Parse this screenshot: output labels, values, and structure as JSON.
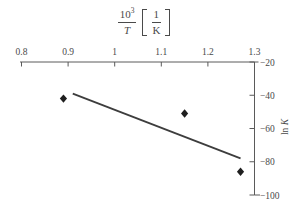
{
  "figure": {
    "background": "#ffffff",
    "axis_color": "#5a5a5a",
    "text_color": "#4a4a4a",
    "point_color": "#1f1f1f",
    "line_color": "#3d3d3d"
  },
  "title": {
    "numerator_base": "10",
    "numerator_exp": "3",
    "denominator": "T",
    "bracket_numerator": "1",
    "bracket_denominator": "K"
  },
  "chart_data": {
    "type": "scatter",
    "xlabel": "10^3/T [1/K]",
    "ylabel_prefix": "ln ",
    "ylabel_symbol": "K",
    "x_axis_position": "top",
    "y_axis_position": "right",
    "grid": false,
    "legend": false,
    "xlim": [
      0.8,
      1.3
    ],
    "ylim": [
      -100,
      -20
    ],
    "x_ticks": [
      0.8,
      0.9,
      1,
      1.1,
      1.2,
      1.3
    ],
    "x_tick_labels": [
      "0.8",
      "0.9",
      "1",
      "1.1",
      "1.2",
      "1.3"
    ],
    "y_ticks": [
      -20,
      -40,
      -60,
      -80,
      -100
    ],
    "y_tick_labels": [
      "−20",
      "−40",
      "−60",
      "−80",
      "−100"
    ],
    "marker": "diamond",
    "points": [
      {
        "x": 0.89,
        "y": -42
      },
      {
        "x": 1.15,
        "y": -51
      },
      {
        "x": 1.27,
        "y": -86
      }
    ],
    "fit_line": {
      "x1": 0.91,
      "y1": -39,
      "x2": 1.27,
      "y2": -78
    }
  }
}
